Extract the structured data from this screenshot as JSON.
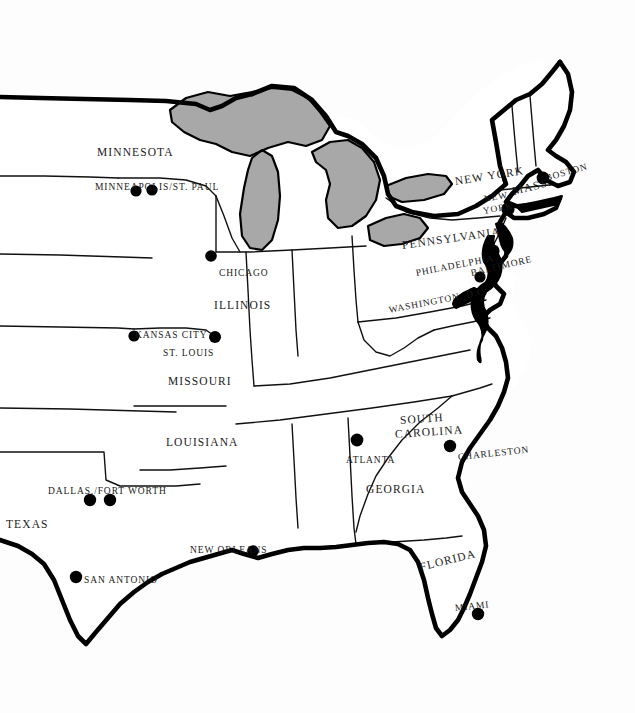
{
  "map": {
    "title": "Eastern United States reference map",
    "background_color": "#fdfdfd",
    "land_color": "#ffffff",
    "lake_color": "#a8a8a8",
    "border_color": "#000000",
    "dot_color": "#000000",
    "state_labels": [
      {
        "text": "MINNESOTA",
        "x": 97,
        "y": 147,
        "rot": 0
      },
      {
        "text": "ILLINOIS",
        "x": 214,
        "y": 300,
        "rot": 0
      },
      {
        "text": "MISSOURI",
        "x": 168,
        "y": 376,
        "rot": 0
      },
      {
        "text": "LOUISIANA",
        "x": 166,
        "y": 437,
        "rot": 0
      },
      {
        "text": "TEXAS",
        "x": 6,
        "y": 519,
        "rot": 0
      },
      {
        "text": "GEORGIA",
        "x": 366,
        "y": 484,
        "rot": 0
      },
      {
        "text": "FLORIDA",
        "x": 420,
        "y": 562,
        "rot": -14
      },
      {
        "text": "SOUTH",
        "x": 400,
        "y": 415,
        "rot": -4
      },
      {
        "text": "CAROLINA",
        "x": 395,
        "y": 429,
        "rot": -4
      },
      {
        "text": "PENNSYLVANIA",
        "x": 402,
        "y": 240,
        "rot": -8
      },
      {
        "text": "NEW YORK",
        "x": 455,
        "y": 176,
        "rot": -9
      },
      {
        "text": "MASS.",
        "x": 513,
        "y": 186,
        "rot": -14
      }
    ],
    "city_labels": [
      {
        "text": "MINNEAPOLIS/ST. PAUL",
        "x": 95,
        "y": 183,
        "rot": 0
      },
      {
        "text": "CHICAGO",
        "x": 219,
        "y": 269,
        "rot": 0
      },
      {
        "text": "KANSAS CITY",
        "x": 135,
        "y": 331,
        "rot": 0
      },
      {
        "text": "ST. LOUIS",
        "x": 163,
        "y": 349,
        "rot": 0
      },
      {
        "text": "DALLAS./FORT WORTH",
        "x": 48,
        "y": 487,
        "rot": 0
      },
      {
        "text": "SAN ANTONIO",
        "x": 84,
        "y": 576,
        "rot": 0
      },
      {
        "text": "NEW ORLEANS",
        "x": 190,
        "y": 546,
        "rot": 0
      },
      {
        "text": "ATLANTA",
        "x": 346,
        "y": 456,
        "rot": 0
      },
      {
        "text": "CHARLESTON",
        "x": 458,
        "y": 453,
        "rot": -6
      },
      {
        "text": "MIAMI",
        "x": 455,
        "y": 604,
        "rot": -6
      },
      {
        "text": "WASHINGTON, D.C.",
        "x": 389,
        "y": 306,
        "rot": -11
      },
      {
        "text": "BALTIMORE",
        "x": 471,
        "y": 269,
        "rot": -13
      },
      {
        "text": "PHILADELPHIA",
        "x": 416,
        "y": 269,
        "rot": -11
      },
      {
        "text": "NEW",
        "x": 484,
        "y": 195,
        "rot": -10
      },
      {
        "text": "YORK",
        "x": 483,
        "y": 207,
        "rot": -10
      },
      {
        "text": "BOSTON",
        "x": 546,
        "y": 174,
        "rot": -16
      }
    ],
    "city_dots": [
      {
        "name": "minneapolis",
        "x": 136,
        "y": 191,
        "r": 5.6
      },
      {
        "name": "saint-paul",
        "x": 152,
        "y": 190,
        "r": 5.6
      },
      {
        "name": "chicago",
        "x": 211,
        "y": 256,
        "r": 5.8
      },
      {
        "name": "kansas-city",
        "x": 134,
        "y": 336,
        "r": 5.6
      },
      {
        "name": "st-louis",
        "x": 215,
        "y": 337,
        "r": 6.0
      },
      {
        "name": "dallas",
        "x": 90,
        "y": 500,
        "r": 6.2
      },
      {
        "name": "fort-worth",
        "x": 110,
        "y": 500,
        "r": 6.2
      },
      {
        "name": "san-antonio",
        "x": 76,
        "y": 577,
        "r": 6.2
      },
      {
        "name": "new-orleans",
        "x": 253,
        "y": 551,
        "r": 5.8
      },
      {
        "name": "atlanta",
        "x": 357,
        "y": 440,
        "r": 6.4
      },
      {
        "name": "charleston",
        "x": 450,
        "y": 446,
        "r": 6.2
      },
      {
        "name": "miami",
        "x": 478,
        "y": 614,
        "r": 6.2
      },
      {
        "name": "washington",
        "x": 474,
        "y": 294,
        "r": 6.6
      },
      {
        "name": "baltimore",
        "x": 480,
        "y": 277,
        "r": 5.6
      },
      {
        "name": "philadelphia",
        "x": 493,
        "y": 251,
        "r": 6.6
      },
      {
        "name": "new-york",
        "x": 508,
        "y": 209,
        "r": 6.6
      },
      {
        "name": "boston",
        "x": 543,
        "y": 178,
        "r": 6.4
      }
    ]
  }
}
